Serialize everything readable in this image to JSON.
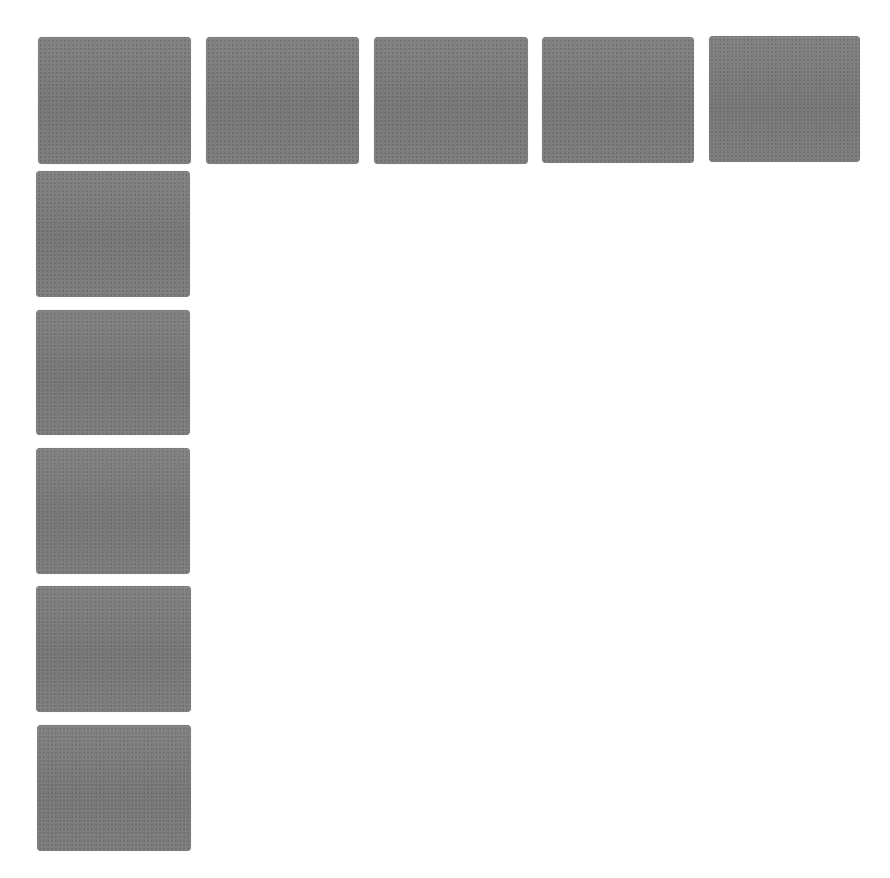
{
  "canvas": {
    "width": 890,
    "height": 878,
    "background": "#ffffff"
  },
  "tile_color": "#7d7d7d",
  "tiles": [
    {
      "id": "row-1",
      "x": 38,
      "y": 37,
      "w": 153,
      "h": 127
    },
    {
      "id": "row-2",
      "x": 206,
      "y": 37,
      "w": 153,
      "h": 127
    },
    {
      "id": "row-3",
      "x": 374,
      "y": 37,
      "w": 154,
      "h": 127
    },
    {
      "id": "row-4",
      "x": 542,
      "y": 37,
      "w": 152,
      "h": 126
    },
    {
      "id": "row-5",
      "x": 709,
      "y": 36,
      "w": 151,
      "h": 126
    },
    {
      "id": "col-1",
      "x": 36,
      "y": 171,
      "w": 154,
      "h": 126
    },
    {
      "id": "col-2",
      "x": 36,
      "y": 310,
      "w": 154,
      "h": 125
    },
    {
      "id": "col-3",
      "x": 36,
      "y": 448,
      "w": 154,
      "h": 126
    },
    {
      "id": "col-4",
      "x": 36,
      "y": 586,
      "w": 155,
      "h": 126
    },
    {
      "id": "col-5",
      "x": 37,
      "y": 725,
      "w": 154,
      "h": 126
    }
  ]
}
